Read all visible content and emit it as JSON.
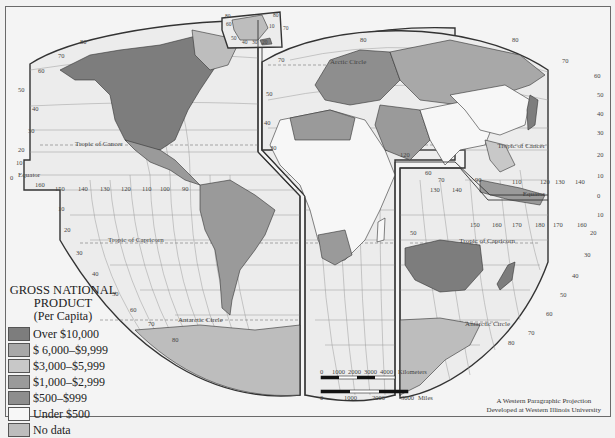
{
  "map": {
    "title": "GROSS NATIONAL PRODUCT",
    "subtitle": "(Per Capita)",
    "projection_note": [
      "A Western Paragraphic Projection",
      "Developed at Western Illinois University"
    ],
    "lines": {
      "equator": "Equator",
      "tropic_cancer": "Tropic of Cancer",
      "tropic_capricorn": "Tropic of Capricorn",
      "arctic_circle": "Arctic Circle",
      "antarctic_circle": "Antarctic Circle"
    },
    "colors": {
      "ocean": "#ececec",
      "grid": "#8a8a8a",
      "border": "#333333"
    }
  },
  "legend": {
    "title_line1": "GROSS NATIONAL",
    "title_line2": "PRODUCT",
    "subtitle": "(Per Capita)",
    "items": [
      {
        "label": "Over $10,000",
        "color": "#7d7d7d"
      },
      {
        "label": "$ 6,000–$9,999",
        "color": "#a8a8a8"
      },
      {
        "label": "$3,000–$5,999",
        "color": "#c8c8c8"
      },
      {
        "label": "$1,000–$2,999",
        "color": "#9a9a9a"
      },
      {
        "label": "$500–$999",
        "color": "#8e8e8e"
      },
      {
        "label": "Under $500",
        "color": "#f7f7f7"
      },
      {
        "label": "No data",
        "color": "#bdbdbd"
      }
    ]
  },
  "scale_bar": {
    "km_ticks": [
      "0",
      "1000",
      "2000",
      "3000",
      "4000"
    ],
    "km_unit": "Kilometers",
    "mi_ticks": [
      "0",
      "1000",
      "2000",
      "3000"
    ],
    "mi_unit": "Miles"
  },
  "graticule_labels": {
    "left_lat": [
      "50",
      "40",
      "30",
      "20",
      "10",
      "0"
    ],
    "left_lower_lat": [
      "10",
      "20",
      "30",
      "40",
      "50",
      "60",
      "70",
      "80"
    ],
    "pacific_lon": [
      "160",
      "150",
      "140",
      "130",
      "120",
      "110",
      "100",
      "90"
    ],
    "right_lat": [
      "60",
      "50",
      "40",
      "30",
      "20",
      "10",
      "0",
      "10",
      "20",
      "30",
      "40",
      "50",
      "60",
      "70",
      "80"
    ],
    "asia_lon": [
      "110",
      "120",
      "130",
      "140"
    ],
    "oceania_lon": [
      "130",
      "140",
      "150",
      "160",
      "170",
      "180",
      "170",
      "160"
    ],
    "greenland": [
      "80",
      "60",
      "50",
      "40",
      "30",
      "20",
      "10",
      "70"
    ],
    "top": [
      "80",
      "70",
      "60",
      "80",
      "70",
      "80",
      "70"
    ]
  }
}
